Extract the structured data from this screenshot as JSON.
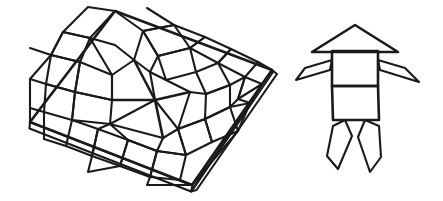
{
  "scene": {
    "title": "Patterned tile board and rocket figure line drawing",
    "background_color": "#ffffff",
    "ink_color": "#1a1a1a",
    "width": 443,
    "height": 201,
    "style": "hand-drawn black ink line art, no fill, no text labels"
  },
  "objects": [
    {
      "name": "tile-board",
      "label": "Patterned square board in perspective",
      "description": "A square tiled board drawn in oblique perspective with visible edge thickness, covered with an eight-pointed star pattern built from rhombi and kite tiles",
      "corners": {
        "top": [
          115,
          11
        ],
        "right": [
          272,
          70
        ],
        "bottom": [
          192,
          185
        ],
        "left": [
          30,
          122
        ]
      },
      "edge_thickness_px": 7,
      "tile_count": 33,
      "pattern": "eight-point star rosette surrounded by rhombus border tiles"
    },
    {
      "name": "rocket-figure",
      "label": "Rocket / robot figure",
      "description": "A symmetric figure made of a triangular cap, a two-part rectangular body, two thin angled arms and two tapered legs",
      "parts": [
        {
          "name": "cap",
          "shape": "triangle",
          "apex": [
            355,
            25
          ]
        },
        {
          "name": "upper-body",
          "shape": "rectangle"
        },
        {
          "name": "lower-body",
          "shape": "rectangle"
        },
        {
          "name": "left-arm",
          "shape": "thin-quadrilateral"
        },
        {
          "name": "right-arm",
          "shape": "thin-quadrilateral"
        },
        {
          "name": "left-leg",
          "shape": "tapered-quadrilateral"
        },
        {
          "name": "right-leg",
          "shape": "tapered-quadrilateral"
        }
      ],
      "bounds": {
        "x": 296,
        "y": 25,
        "width": 124,
        "height": 148
      }
    }
  ],
  "chart_data": null
}
